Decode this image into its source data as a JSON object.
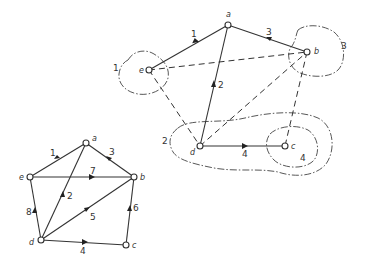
{
  "figure": {
    "colors": {
      "ink": "#333333",
      "background": "#ffffff"
    }
  },
  "small_graph": {
    "nodes": [
      {
        "id": "a",
        "label": "a",
        "x": 86,
        "y": 143
      },
      {
        "id": "b",
        "label": "b",
        "x": 134,
        "y": 177
      },
      {
        "id": "c",
        "label": "c",
        "x": 126,
        "y": 245
      },
      {
        "id": "d",
        "label": "d",
        "x": 41,
        "y": 240
      },
      {
        "id": "e",
        "label": "e",
        "x": 30,
        "y": 177
      }
    ],
    "edges": [
      {
        "label": "1",
        "from": "e",
        "to": "a"
      },
      {
        "label": "2",
        "from": "d",
        "to": "a"
      },
      {
        "label": "3",
        "from": "b",
        "to": "a"
      },
      {
        "label": "4",
        "from": "d",
        "to": "c"
      },
      {
        "label": "5",
        "from": "d",
        "to": "b"
      },
      {
        "label": "6",
        "from": "c",
        "to": "b"
      },
      {
        "label": "7",
        "from": "e",
        "to": "b"
      },
      {
        "label": "8",
        "from": "d",
        "to": "e"
      }
    ]
  },
  "large_graph": {
    "nodes": [
      {
        "id": "a",
        "label": "a",
        "x": 228,
        "y": 25
      },
      {
        "id": "b",
        "label": "b",
        "x": 307,
        "y": 52
      },
      {
        "id": "c",
        "label": "c",
        "x": 285,
        "y": 146
      },
      {
        "id": "d",
        "label": "d",
        "x": 200,
        "y": 146
      },
      {
        "id": "e",
        "label": "e",
        "x": 149,
        "y": 70
      }
    ],
    "solid_edges": [
      {
        "label": "1",
        "from": "e",
        "to": "a"
      },
      {
        "label": "2",
        "from": "d",
        "to": "a"
      },
      {
        "label": "3",
        "from": "b",
        "to": "a"
      },
      {
        "label": "4",
        "from": "d",
        "to": "c"
      }
    ],
    "dashed_edges": [
      {
        "from": "e",
        "to": "b"
      },
      {
        "from": "e",
        "to": "d"
      },
      {
        "from": "d",
        "to": "b"
      },
      {
        "from": "b",
        "to": "c"
      }
    ],
    "clusters": [
      {
        "label": "1",
        "contains": [
          "e"
        ]
      },
      {
        "label": "2",
        "contains": [
          "d",
          "c"
        ]
      },
      {
        "label": "3",
        "contains": [
          "b"
        ]
      },
      {
        "label": "4",
        "contains": [
          "c"
        ]
      }
    ]
  }
}
